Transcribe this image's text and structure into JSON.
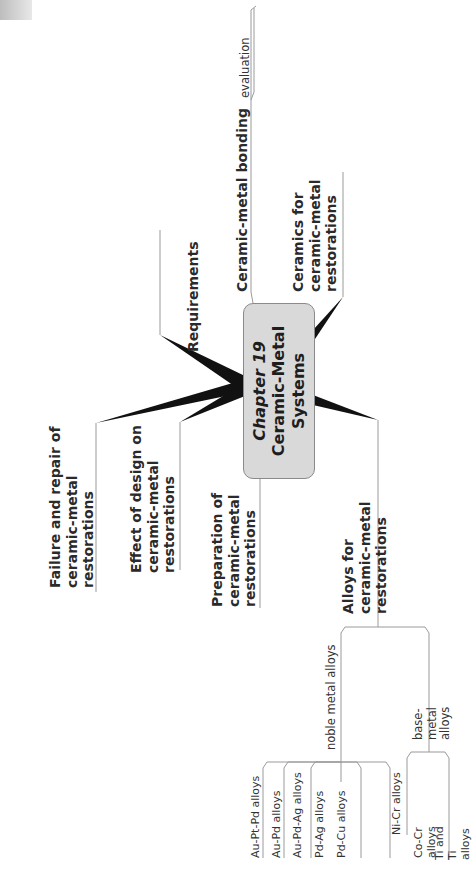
{
  "central_node": {
    "line1": "Chapter 19",
    "line2": "Ceramic-Metal",
    "line3": "Systems",
    "fill": "#d9d9d9"
  },
  "branches": {
    "ceramic_metal_bonding": {
      "label": "Ceramic-metal bonding",
      "children": [
        "evaluation"
      ]
    },
    "ceramics": {
      "label": "Ceramics for\nceramic-metal\nrestorations"
    },
    "requirements": {
      "label": "Requirements"
    },
    "failure_repair": {
      "label": "Failure and repair of\nceramic-metal\nrestorations"
    },
    "effect_design": {
      "label": "Effect of design on\nceramic-metal\nrestorations"
    },
    "preparation": {
      "label": "Preparation of\nceramic-metal\nrestorations"
    },
    "alloys": {
      "label": "Alloys for ceramic-metal\nrestorations",
      "noble": {
        "label": "noble metal alloys",
        "children": [
          "Au-Pt-Pd alloys",
          "Au-Pd alloys",
          "Au-Pd-Ag alloys",
          "Pd-Ag alloys",
          "Pd-Cu alloys"
        ]
      },
      "base": {
        "label": "base-metal alloys",
        "children": [
          "Ni-Cr alloys",
          "Co-Cr alloys",
          "Ti and Ti alloys"
        ]
      }
    }
  },
  "colors": {
    "connector": "#111111",
    "thin_line": "#9a9a9a",
    "node_border": "#8a8a8a"
  }
}
